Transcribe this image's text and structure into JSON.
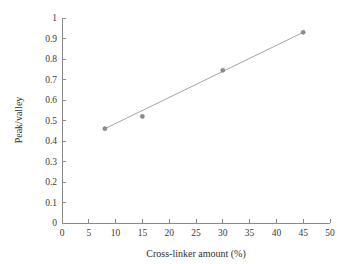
{
  "chart_data": {
    "type": "scatter",
    "title": "",
    "xlabel": "Cross-linker amount (%)",
    "ylabel": "Peak/valley",
    "xlim": [
      0,
      50
    ],
    "ylim": [
      0,
      1
    ],
    "grid": false,
    "legend": null,
    "x": [
      8,
      15,
      30,
      45
    ],
    "values": [
      0.46,
      0.52,
      0.745,
      0.93
    ],
    "series": [
      {
        "name": "Peak/valley vs cross-linker amount",
        "marker": "dot",
        "color": "#8c8c8c",
        "points": [
          {
            "x": 8,
            "y": 0.46
          },
          {
            "x": 15,
            "y": 0.52
          },
          {
            "x": 30,
            "y": 0.745
          },
          {
            "x": 45,
            "y": 0.93
          }
        ]
      }
    ],
    "trend_line": {
      "visible": true,
      "color": "#9a9a9a",
      "start": {
        "x": 8,
        "y": 0.46
      },
      "end": {
        "x": 45,
        "y": 0.93
      }
    },
    "xticks": [
      {
        "value": 0,
        "label": "0"
      },
      {
        "value": 5,
        "label": "5"
      },
      {
        "value": 10,
        "label": "10"
      },
      {
        "value": 15,
        "label": "15"
      },
      {
        "value": 20,
        "label": "20"
      },
      {
        "value": 25,
        "label": "25"
      },
      {
        "value": 30,
        "label": "30"
      },
      {
        "value": 35,
        "label": "35"
      },
      {
        "value": 40,
        "label": "40"
      },
      {
        "value": 45,
        "label": "45"
      },
      {
        "value": 50,
        "label": "50"
      }
    ],
    "yticks": [
      {
        "value": 0,
        "label": "0"
      },
      {
        "value": 0.1,
        "label": "0.1"
      },
      {
        "value": 0.2,
        "label": "0.2"
      },
      {
        "value": 0.3,
        "label": "0.3"
      },
      {
        "value": 0.4,
        "label": "0.4"
      },
      {
        "value": 0.5,
        "label": "0.5"
      },
      {
        "value": 0.6,
        "label": "0.6"
      },
      {
        "value": 0.7,
        "label": "0.7"
      },
      {
        "value": 0.8,
        "label": "0.8"
      },
      {
        "value": 0.9,
        "label": "0.9"
      },
      {
        "value": 1,
        "label": "1"
      }
    ],
    "colors": {
      "axis": "#8a8a8a",
      "marker": "#8c8c8c",
      "line": "#9a9a9a",
      "text": "#2e2e2e",
      "background": "#ffffff"
    }
  }
}
